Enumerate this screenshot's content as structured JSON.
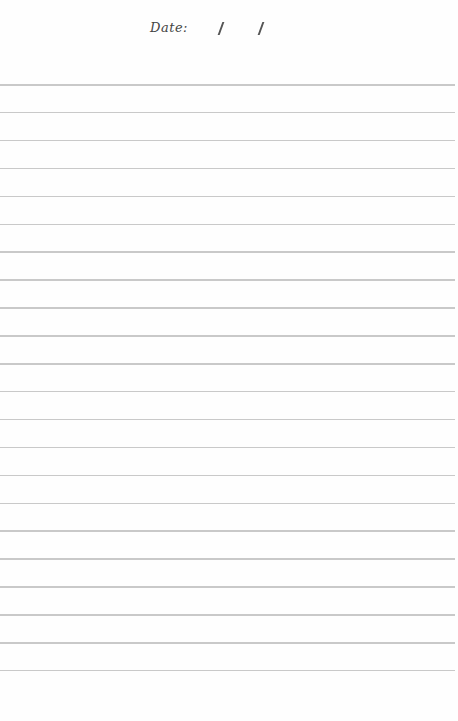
{
  "page": {
    "type": "lined-paper",
    "date_field": {
      "label": "Date:",
      "separators": [
        "/",
        "/"
      ]
    },
    "lines": {
      "count": 22,
      "first_y": 84,
      "spacing": 27.9,
      "color": "#c9c9c9"
    },
    "background": "#fefefe"
  }
}
